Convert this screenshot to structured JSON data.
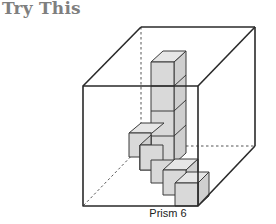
{
  "heading": "Try This",
  "figure": {
    "caption": "Prism 6",
    "colors": {
      "edge": "#2a2a2a",
      "cube_front": "#d9d9d9",
      "cube_top": "#e6e6e6",
      "cube_side": "#cfcfcf",
      "heading": "#7f7f7f"
    }
  }
}
